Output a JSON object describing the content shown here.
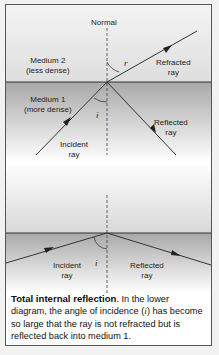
{
  "diagram": {
    "upper": {
      "normal_label": "Normal",
      "medium2_name": "Medium 2",
      "medium2_desc": "(less dense)",
      "medium1_name": "Medium 1",
      "medium1_desc": "(more dense)",
      "refracted_label_1": "Refracted",
      "refracted_label_2": "ray",
      "reflected_label_1": "Reflected",
      "reflected_label_2": "ray",
      "incident_label_1": "Incident",
      "incident_label_2": "ray",
      "angle_r": "r",
      "angle_i": "i"
    },
    "lower": {
      "incident_label_1": "Incident",
      "incident_label_2": "ray",
      "reflected_label_1": "Reflected",
      "reflected_label_2": "ray",
      "angle_i": "i"
    },
    "colors": {
      "medium2": "#e4e4e4",
      "medium1": "#a9a9a9",
      "line": "#333333",
      "frame": "#555555"
    }
  },
  "caption": {
    "title": "Total internal reflection",
    "text_1": ". In the lower diagram, the angle of incidence (",
    "symbol": "i",
    "text_2": ") has become so large that the ray is not refracted but is reflected back into medium 1."
  }
}
